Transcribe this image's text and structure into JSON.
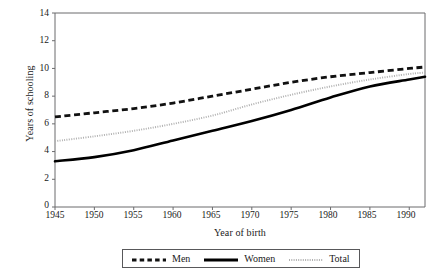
{
  "chart_data": {
    "type": "line",
    "title": "",
    "xlabel": "Year of birth",
    "ylabel": "Years of schooling",
    "xlim": [
      1945,
      1992
    ],
    "ylim": [
      0,
      14
    ],
    "xticks": [
      1945,
      1950,
      1955,
      1960,
      1965,
      1970,
      1975,
      1980,
      1985,
      1990
    ],
    "yticks": [
      0,
      2,
      4,
      6,
      8,
      10,
      12,
      14
    ],
    "grid": false,
    "legend_position": "bottom-center",
    "x": [
      1945,
      1950,
      1955,
      1960,
      1965,
      1970,
      1975,
      1980,
      1985,
      1990,
      1992
    ],
    "series": [
      {
        "name": "Men",
        "style": "dashed",
        "color": "#111111",
        "values": [
          6.5,
          6.8,
          7.1,
          7.5,
          8.0,
          8.5,
          9.0,
          9.4,
          9.7,
          10.0,
          10.1
        ]
      },
      {
        "name": "Women",
        "style": "solid",
        "color": "#000000",
        "values": [
          3.3,
          3.6,
          4.1,
          4.8,
          5.5,
          6.2,
          7.0,
          7.9,
          8.7,
          9.2,
          9.4
        ]
      },
      {
        "name": "Total",
        "style": "dotted",
        "color": "#b0b0b0",
        "values": [
          4.75,
          5.1,
          5.5,
          6.0,
          6.6,
          7.4,
          8.1,
          8.7,
          9.2,
          9.6,
          9.7
        ]
      }
    ]
  },
  "axes": {
    "y_title": "Years of schooling",
    "x_title": "Year of birth",
    "y_ticks": [
      "14",
      "12",
      "10",
      "8",
      "6",
      "4",
      "2",
      "0"
    ],
    "x_ticks": [
      "1945",
      "1950",
      "1955",
      "1960",
      "1965",
      "1970",
      "1975",
      "1980",
      "1985",
      "1990"
    ]
  },
  "legend": {
    "items": [
      {
        "label": "Men",
        "swatch": "dashed-line-swatch"
      },
      {
        "label": "Women",
        "swatch": "solid-line-swatch"
      },
      {
        "label": "Total",
        "swatch": "dotted-line-swatch"
      }
    ]
  }
}
